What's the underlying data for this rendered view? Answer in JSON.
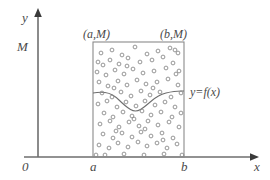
{
  "figure": {
    "colors": {
      "axis": "#6e6e6e",
      "rect": "#8a8a8a",
      "curve": "#6e6e6e",
      "dot": "#8a8a8a",
      "text": "#4a4a4a",
      "background": "#ffffff"
    }
  },
  "axes": {
    "y_label": "y",
    "x_label": "x",
    "origin_label": "0",
    "y_tick_label": "M",
    "x_tick_left_label": "a",
    "x_tick_right_label": "b"
  },
  "annotations": {
    "corner_top_left": "(a,M)",
    "corner_top_right": "(b,M)",
    "curve_label": "y=f(x)"
  },
  "chart_data": {
    "type": "scatter",
    "title": "",
    "xlabel": "x",
    "ylabel": "y",
    "xlim": [
      0,
      270
    ],
    "ylim": [
      0,
      180
    ],
    "grid": false,
    "legend": null,
    "region": {
      "x_left": 93,
      "x_right": 184,
      "y_top": 42,
      "y_bottom": 157,
      "label_left": "a",
      "label_right": "b",
      "label_top": "M",
      "label_bottom": "0"
    },
    "curve": {
      "name": "y=f(x)",
      "points": [
        [
          93,
          93
        ],
        [
          101,
          92
        ],
        [
          109,
          93
        ],
        [
          116,
          97
        ],
        [
          122,
          103
        ],
        [
          128,
          108
        ],
        [
          133,
          111
        ],
        [
          138,
          111
        ],
        [
          143,
          108
        ],
        [
          149,
          103
        ],
        [
          155,
          98
        ],
        [
          162,
          94
        ],
        [
          170,
          92
        ],
        [
          178,
          91
        ],
        [
          184,
          91
        ]
      ]
    },
    "points": [
      [
        101,
        53
      ],
      [
        112,
        50
      ],
      [
        122,
        55
      ],
      [
        135,
        47
      ],
      [
        147,
        54
      ],
      [
        158,
        51
      ],
      [
        170,
        48
      ],
      [
        178,
        53
      ],
      [
        175,
        50
      ],
      [
        98,
        62
      ],
      [
        103,
        65
      ],
      [
        110,
        60
      ],
      [
        119,
        64
      ],
      [
        128,
        58
      ],
      [
        140,
        62
      ],
      [
        152,
        60
      ],
      [
        163,
        57
      ],
      [
        173,
        63
      ],
      [
        97,
        72
      ],
      [
        106,
        75
      ],
      [
        115,
        70
      ],
      [
        124,
        74
      ],
      [
        133,
        69
      ],
      [
        143,
        73
      ],
      [
        154,
        71
      ],
      [
        166,
        68
      ],
      [
        176,
        74
      ],
      [
        179,
        71
      ],
      [
        99,
        82
      ],
      [
        108,
        86
      ],
      [
        118,
        81
      ],
      [
        127,
        85
      ],
      [
        137,
        80
      ],
      [
        146,
        84
      ],
      [
        157,
        82
      ],
      [
        168,
        79
      ],
      [
        178,
        85
      ],
      [
        102,
        93
      ],
      [
        112,
        97
      ],
      [
        121,
        92
      ],
      [
        131,
        96
      ],
      [
        141,
        91
      ],
      [
        150,
        95
      ],
      [
        160,
        92
      ],
      [
        171,
        97
      ],
      [
        181,
        93
      ],
      [
        98,
        104
      ],
      [
        107,
        101
      ],
      [
        117,
        107
      ],
      [
        126,
        102
      ],
      [
        136,
        106
      ],
      [
        145,
        101
      ],
      [
        155,
        105
      ],
      [
        165,
        102
      ],
      [
        175,
        107
      ],
      [
        104,
        113
      ],
      [
        113,
        117
      ],
      [
        123,
        112
      ],
      [
        132,
        116
      ],
      [
        142,
        111
      ],
      [
        151,
        115
      ],
      [
        161,
        112
      ],
      [
        172,
        117
      ],
      [
        181,
        113
      ],
      [
        100,
        124
      ],
      [
        110,
        121
      ],
      [
        119,
        127
      ],
      [
        129,
        122
      ],
      [
        139,
        126
      ],
      [
        148,
        121
      ],
      [
        158,
        125
      ],
      [
        169,
        122
      ],
      [
        179,
        127
      ],
      [
        103,
        134
      ],
      [
        113,
        138
      ],
      [
        122,
        133
      ],
      [
        132,
        137
      ],
      [
        141,
        132
      ],
      [
        151,
        136
      ],
      [
        162,
        133
      ],
      [
        173,
        138
      ],
      [
        99,
        145
      ],
      [
        109,
        148
      ],
      [
        118,
        143
      ],
      [
        128,
        147
      ],
      [
        138,
        142
      ],
      [
        147,
        146
      ],
      [
        157,
        143
      ],
      [
        167,
        148
      ],
      [
        177,
        144
      ],
      [
        105,
        155
      ],
      [
        124,
        154
      ],
      [
        144,
        155
      ],
      [
        164,
        154
      ],
      [
        182,
        155
      ],
      [
        96,
        155
      ],
      [
        114,
        88
      ],
      [
        134,
        119
      ],
      [
        153,
        88
      ],
      [
        116,
        131
      ],
      [
        163,
        140
      ],
      [
        127,
        66
      ],
      [
        145,
        129
      ]
    ]
  }
}
